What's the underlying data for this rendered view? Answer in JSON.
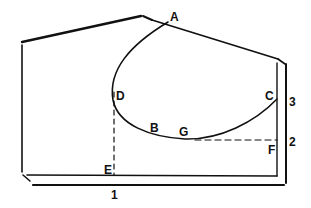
{
  "diagram": {
    "type": "line-drawing",
    "stroke_color": "#111111",
    "background": "#ffffff",
    "point_labels": [
      {
        "id": "A",
        "text": "A"
      },
      {
        "id": "B",
        "text": "B"
      },
      {
        "id": "C",
        "text": "C"
      },
      {
        "id": "D",
        "text": "D"
      },
      {
        "id": "E",
        "text": "E"
      },
      {
        "id": "F",
        "text": "F"
      },
      {
        "id": "G",
        "text": "G"
      }
    ],
    "dimension_labels": [
      {
        "id": "1",
        "text": "1"
      },
      {
        "id": "2",
        "text": "2"
      },
      {
        "id": "3",
        "text": "3"
      }
    ]
  }
}
